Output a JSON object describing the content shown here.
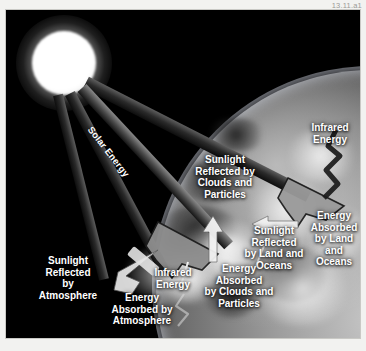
{
  "figure": {
    "id_label": "13.11.a1"
  },
  "scene": {
    "sun_name": "sun",
    "earth_name": "earth",
    "background_color": "#000000",
    "label_color": "#ffffff",
    "frame_color": "#f2f2f0"
  },
  "labels": {
    "solar_energy": "Solar Energy",
    "infrared_energy_top": "Infrared\nEnergy",
    "sunlight_reflected_clouds": "Sunlight\nReflected by\nClouds and\nParticles",
    "sunlight_reflected_land": "Sunlight\nReflected\nby Land and\nOceans",
    "energy_absorbed_land": "Energy\nAbsorbed\nby Land\nand\nOceans",
    "sunlight_reflected_atmosphere": "Sunlight\nReflected\nby\nAtmosphere",
    "infrared_energy_lower": "Infrared\nEnergy",
    "energy_absorbed_atmosphere": "Energy\nAbsorbed by\nAtmosphere",
    "energy_absorbed_clouds": "Energy\nAbsorbed\nby Clouds and\nParticles"
  },
  "flows": [
    {
      "name": "solar-energy-ray",
      "kind": "incoming-solar",
      "label": "Solar Energy"
    },
    {
      "name": "infrared-energy-emission",
      "kind": "outgoing-infrared",
      "label": "Infrared Energy"
    },
    {
      "name": "sunlight-reflected-by-clouds",
      "kind": "reflected",
      "label": "Sunlight Reflected by Clouds and Particles"
    },
    {
      "name": "sunlight-reflected-by-land-and-oceans",
      "kind": "reflected",
      "label": "Sunlight Reflected by Land and Oceans"
    },
    {
      "name": "energy-absorbed-by-land-and-oceans",
      "kind": "absorbed",
      "label": "Energy Absorbed by Land and Oceans"
    },
    {
      "name": "sunlight-reflected-by-atmosphere",
      "kind": "reflected",
      "label": "Sunlight Reflected by Atmosphere"
    },
    {
      "name": "energy-absorbed-by-atmosphere",
      "kind": "absorbed",
      "label": "Energy Absorbed by Atmosphere"
    },
    {
      "name": "energy-absorbed-by-clouds-and-particles",
      "kind": "absorbed",
      "label": "Energy Absorbed by Clouds and Particles"
    }
  ]
}
